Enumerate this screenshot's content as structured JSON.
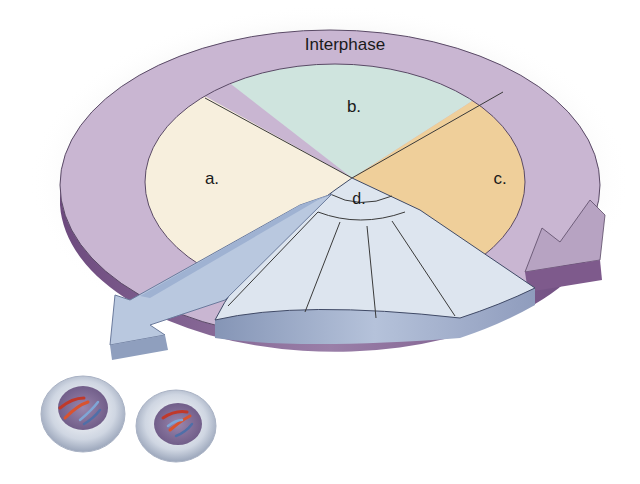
{
  "diagram": {
    "type": "cell-cycle",
    "ring_label": "Interphase",
    "sectors": [
      {
        "id": "a",
        "label": "a.",
        "color": "#f7efdd"
      },
      {
        "id": "b",
        "label": "b.",
        "color": "#cfe4de"
      },
      {
        "id": "c",
        "label": "c.",
        "color": "#efcf9a"
      },
      {
        "id": "d",
        "label": "d.",
        "color": "#dde5ef"
      }
    ],
    "mitotic_subdivisions": 5,
    "daughter_cells": 2,
    "colors": {
      "interphase_ring_top": "#c9b6d2",
      "interphase_ring_side": "#7e5a8c",
      "mitosis_arrow": "#b9c8df",
      "mitosis_side": "#8f9fbe",
      "outline": "#4a4a4a"
    }
  }
}
